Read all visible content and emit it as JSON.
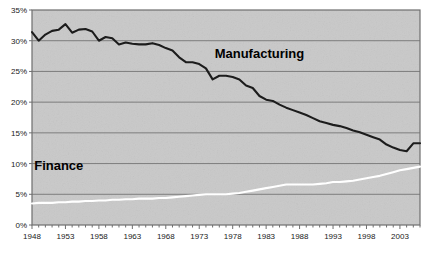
{
  "chart_data": {
    "type": "line",
    "title": "",
    "xlabel": "",
    "ylabel": "",
    "xlim": [
      1948,
      2006
    ],
    "ylim": [
      0,
      35
    ],
    "grid": true,
    "grid_axis": "y",
    "legend_position": "inline-annotation",
    "y_tick_labels": [
      "0%",
      "5%",
      "10%",
      "15%",
      "20%",
      "25%",
      "30%",
      "35%"
    ],
    "y_tick_values": [
      0,
      5,
      10,
      15,
      20,
      25,
      30,
      35
    ],
    "x_tick_labels": [
      "1948",
      "1953",
      "1958",
      "1963",
      "1968",
      "1973",
      "1978",
      "1983",
      "1988",
      "1993",
      "1998",
      "2003"
    ],
    "x_tick_values": [
      1948,
      1953,
      1958,
      1963,
      1968,
      1973,
      1978,
      1983,
      1988,
      1993,
      1998,
      2003
    ],
    "x_minor_tick_step": 1,
    "x": [
      1948,
      1949,
      1950,
      1951,
      1952,
      1953,
      1954,
      1955,
      1956,
      1957,
      1958,
      1959,
      1960,
      1961,
      1962,
      1963,
      1964,
      1965,
      1966,
      1967,
      1968,
      1969,
      1970,
      1971,
      1972,
      1973,
      1974,
      1975,
      1976,
      1977,
      1978,
      1979,
      1980,
      1981,
      1982,
      1983,
      1984,
      1985,
      1986,
      1987,
      1988,
      1989,
      1990,
      1991,
      1992,
      1993,
      1994,
      1995,
      1996,
      1997,
      1998,
      1999,
      2000,
      2001,
      2002,
      2003,
      2004,
      2005,
      2006
    ],
    "series": [
      {
        "name": "Manufacturing",
        "color": "#1c1c1c",
        "line_width": 2.1,
        "annotation_label": "Manufacturing",
        "values": [
          31.4,
          30.0,
          31.0,
          31.6,
          31.8,
          32.7,
          31.3,
          31.8,
          31.9,
          31.5,
          30.0,
          30.6,
          30.4,
          29.4,
          29.7,
          29.5,
          29.4,
          29.4,
          29.6,
          29.3,
          28.8,
          28.4,
          27.3,
          26.5,
          26.5,
          26.2,
          25.5,
          23.7,
          24.3,
          24.3,
          24.1,
          23.7,
          22.7,
          22.3,
          21.0,
          20.4,
          20.2,
          19.6,
          19.1,
          18.7,
          18.3,
          17.9,
          17.4,
          16.9,
          16.6,
          16.3,
          16.1,
          15.8,
          15.4,
          15.1,
          14.7,
          14.3,
          13.9,
          13.1,
          12.6,
          12.2,
          12.0,
          13.3,
          13.3
        ]
      },
      {
        "name": "Finance",
        "color": "#ffffff",
        "line_width": 2.1,
        "annotation_label": "Finance",
        "values": [
          3.5,
          3.6,
          3.6,
          3.6,
          3.7,
          3.7,
          3.8,
          3.8,
          3.9,
          3.9,
          4.0,
          4.0,
          4.1,
          4.1,
          4.2,
          4.2,
          4.3,
          4.3,
          4.3,
          4.4,
          4.4,
          4.5,
          4.6,
          4.7,
          4.8,
          4.9,
          5.0,
          5.0,
          5.0,
          5.0,
          5.1,
          5.2,
          5.4,
          5.6,
          5.8,
          6.0,
          6.2,
          6.4,
          6.6,
          6.6,
          6.6,
          6.6,
          6.6,
          6.7,
          6.8,
          7.0,
          7.0,
          7.1,
          7.2,
          7.4,
          7.6,
          7.8,
          8.0,
          8.3,
          8.6,
          8.9,
          9.1,
          9.3,
          9.5
        ]
      }
    ]
  },
  "style": {
    "plot_background": "#c9c9c9",
    "plot_border": "#6e6e6e",
    "gridline_color": "#7d7d7d",
    "tick_label_color": "#1a1a1a",
    "page_background": "#ffffff"
  },
  "annotations": [
    {
      "text": "Manufacturing",
      "x_value": 1982,
      "y_value": 27.2
    },
    {
      "text": "Finance",
      "x_value": 1952,
      "y_value": 9.0
    }
  ]
}
